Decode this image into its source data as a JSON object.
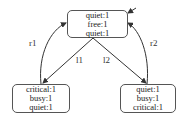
{
  "diagram": {
    "nodes": [
      {
        "id": "top",
        "lines": [
          "quiet:1",
          "free:1",
          "quiet:1"
        ],
        "initial": true
      },
      {
        "id": "left",
        "lines": [
          "critical:1",
          "busy:1",
          "quiet:1"
        ]
      },
      {
        "id": "right",
        "lines": [
          "quiet:1",
          "busy:1",
          "critical:1"
        ]
      }
    ],
    "edges": [
      {
        "from": "left",
        "to": "top",
        "label": "r1"
      },
      {
        "from": "top",
        "to": "left",
        "label": "l1"
      },
      {
        "from": "top",
        "to": "right",
        "label": "l2"
      },
      {
        "from": "right",
        "to": "top",
        "label": "r2"
      }
    ]
  }
}
